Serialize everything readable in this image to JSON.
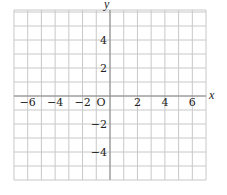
{
  "diagram": {
    "type": "coordinate-grid",
    "x_axis_label": "x",
    "y_axis_label": "y",
    "origin_label": "O",
    "x_range": [
      -7,
      7
    ],
    "y_range": [
      -6,
      6
    ],
    "grid_step": 1,
    "x_tick_labels": [
      {
        "value": -6,
        "text": "−6"
      },
      {
        "value": -4,
        "text": "−4"
      },
      {
        "value": -2,
        "text": "−2"
      },
      {
        "value": 2,
        "text": "2"
      },
      {
        "value": 4,
        "text": "4"
      },
      {
        "value": 6,
        "text": "6"
      }
    ],
    "y_tick_labels": [
      {
        "value": 4,
        "text": "4"
      },
      {
        "value": 2,
        "text": "2"
      },
      {
        "value": -2,
        "text": "−2"
      },
      {
        "value": -4,
        "text": "−4"
      }
    ],
    "colors": {
      "grid": "#c8c8c8",
      "axis": "#888888",
      "text": "#222222"
    }
  }
}
